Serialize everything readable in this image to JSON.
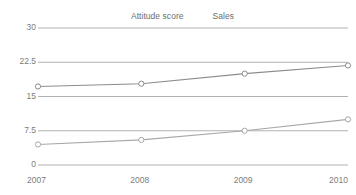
{
  "chart_data": {
    "type": "line",
    "title": "",
    "subtitle": "",
    "xlabel": "",
    "ylabel": "",
    "categories": [
      "2007",
      "2008",
      "2009",
      "2010"
    ],
    "x": [
      2007,
      2008,
      2009,
      2010
    ],
    "series": [
      {
        "name": "Attitude score",
        "values": [
          17.2,
          17.8,
          20.0,
          21.8
        ],
        "color": "#8c8c8c",
        "marker": "circle-open"
      },
      {
        "name": "Sales",
        "values": [
          4.5,
          5.5,
          7.5,
          10.0
        ],
        "color": "#a8a8a8",
        "marker": "circle-open"
      }
    ],
    "ylim": [
      0,
      30
    ],
    "yticks": [
      "0",
      "7.5",
      "15",
      "22.5",
      "30"
    ],
    "ytick_values": [
      0,
      7.5,
      15,
      22.5,
      30
    ],
    "grid": true,
    "grid_axis": "y",
    "legend_position": "top-center",
    "background_color": "#ffffff",
    "grid_color": "#a9a9a9",
    "tick_label_color": "#7d7d7d"
  },
  "legend": {
    "entries": [
      {
        "label": "Attitude score"
      },
      {
        "label": "Sales"
      }
    ]
  }
}
